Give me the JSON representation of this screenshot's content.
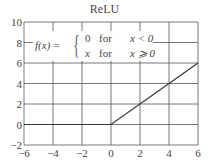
{
  "chart_data": {
    "type": "line",
    "title": "ReLU",
    "xlabel": "",
    "ylabel": "",
    "xlim": [
      -6,
      6
    ],
    "ylim": [
      -2,
      10
    ],
    "x_ticks": [
      "−6",
      "−4",
      "−2",
      "0",
      "2",
      "4",
      "6"
    ],
    "y_ticks": [
      "−2",
      "0",
      "2",
      "4",
      "6",
      "8",
      "10"
    ],
    "grid": true,
    "series": [
      {
        "name": "f(x)",
        "x": [
          -6,
          0,
          6
        ],
        "y": [
          0,
          0,
          6
        ],
        "color": "#333333"
      }
    ],
    "annotation": {
      "label": "f(x) =",
      "cases": [
        {
          "value": "0",
          "word": "for",
          "condition": "x < 0"
        },
        {
          "value": "x",
          "word": "for",
          "condition": "x ⩾ 0"
        }
      ]
    }
  }
}
